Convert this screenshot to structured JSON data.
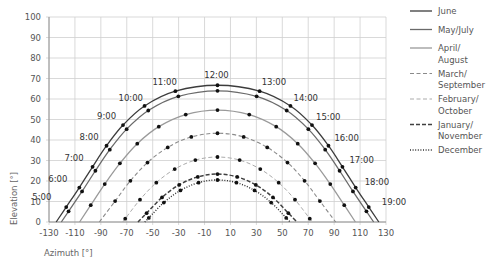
{
  "chart_data": {
    "type": "line",
    "title": "",
    "xlabel": "Azimuth [°]",
    "ylabel": "Elevation [°]",
    "xlim": [
      -130,
      130
    ],
    "ylim": [
      0,
      100
    ],
    "xticks": [
      -130,
      -110,
      -90,
      -70,
      -50,
      -30,
      -10,
      10,
      30,
      50,
      70,
      90,
      110,
      130
    ],
    "yticks": [
      0,
      10,
      20,
      30,
      40,
      50,
      60,
      70,
      80,
      90,
      100
    ],
    "grid": true,
    "legend_position": "right",
    "time_labels": [
      "5:00",
      "6:00",
      "7:00",
      "8:00",
      "9:00",
      "10:00",
      "11:00",
      "12:00",
      "13:00",
      "14:00",
      "15:00",
      "16:00",
      "17:00",
      "18:00",
      "19:00"
    ],
    "series": [
      {
        "name": "June",
        "legend_lines": [
          "June"
        ],
        "style": "solid",
        "color": "#3c3c3c",
        "points": [
          {
            "time": "5:00",
            "az": -116.7,
            "el": 7.3
          },
          {
            "time": "6:00",
            "az": -106.6,
            "el": 16.8
          },
          {
            "time": "7:00",
            "az": -96.4,
            "el": 26.9
          },
          {
            "time": "8:00",
            "az": -85.6,
            "el": 37.2
          },
          {
            "time": "9:00",
            "az": -72.9,
            "el": 47.3
          },
          {
            "time": "10:00",
            "az": -56.3,
            "el": 56.6
          },
          {
            "time": "11:00",
            "az": -32.5,
            "el": 63.8
          },
          {
            "time": "12:00",
            "az": 0,
            "el": 66.7
          },
          {
            "time": "13:00",
            "az": 32.5,
            "el": 63.8
          },
          {
            "time": "14:00",
            "az": 56.3,
            "el": 56.6
          },
          {
            "time": "15:00",
            "az": 72.9,
            "el": 47.3
          },
          {
            "time": "16:00",
            "az": 85.6,
            "el": 37.2
          },
          {
            "time": "17:00",
            "az": 96.4,
            "el": 26.9
          },
          {
            "time": "18:00",
            "az": 106.6,
            "el": 16.8
          },
          {
            "time": "19:00",
            "az": 116.7,
            "el": 7.3
          }
        ]
      },
      {
        "name": "May/July",
        "legend_lines": [
          "May/July"
        ],
        "style": "solid",
        "color": "#6a6a6a",
        "points": [
          {
            "time": "5:00",
            "az": -114.9,
            "el": 5.2
          },
          {
            "time": "6:00",
            "az": -104.5,
            "el": 14.9
          },
          {
            "time": "7:00",
            "az": -94.2,
            "el": 25.0
          },
          {
            "time": "8:00",
            "az": -83.1,
            "el": 35.3
          },
          {
            "time": "9:00",
            "az": -70.1,
            "el": 45.3
          },
          {
            "time": "10:00",
            "az": -53.4,
            "el": 54.4
          },
          {
            "time": "11:00",
            "az": -30.2,
            "el": 61.3
          },
          {
            "time": "12:00",
            "az": 0,
            "el": 64.0
          },
          {
            "time": "13:00",
            "az": 30.2,
            "el": 61.3
          },
          {
            "time": "14:00",
            "az": 53.4,
            "el": 54.4
          },
          {
            "time": "15:00",
            "az": 70.1,
            "el": 45.3
          },
          {
            "time": "16:00",
            "az": 83.1,
            "el": 35.3
          },
          {
            "time": "17:00",
            "az": 94.2,
            "el": 25.0
          },
          {
            "time": "18:00",
            "az": 104.5,
            "el": 14.9
          },
          {
            "time": "19:00",
            "az": 114.9,
            "el": 5.2
          }
        ]
      },
      {
        "name": "April/August",
        "legend_lines": [
          "April/",
          "August"
        ],
        "style": "solid",
        "color": "#9a9a9a",
        "points": [
          {
            "time": "6:00",
            "az": -97.8,
            "el": 8.2
          },
          {
            "time": "7:00",
            "az": -87.0,
            "el": 18.5
          },
          {
            "time": "8:00",
            "az": -75.3,
            "el": 28.6
          },
          {
            "time": "9:00",
            "az": -61.9,
            "el": 38.2
          },
          {
            "time": "10:00",
            "az": -45.3,
            "el": 46.5
          },
          {
            "time": "11:00",
            "az": -24.5,
            "el": 52.4
          },
          {
            "time": "12:00",
            "az": 0,
            "el": 54.6
          },
          {
            "time": "13:00",
            "az": 24.5,
            "el": 52.4
          },
          {
            "time": "14:00",
            "az": 45.3,
            "el": 46.5
          },
          {
            "time": "15:00",
            "az": 61.9,
            "el": 38.2
          },
          {
            "time": "16:00",
            "az": 75.3,
            "el": 28.6
          },
          {
            "time": "17:00",
            "az": 87.0,
            "el": 18.5
          },
          {
            "time": "18:00",
            "az": 97.8,
            "el": 8.2
          }
        ]
      },
      {
        "name": "March/September",
        "legend_lines": [
          "March/",
          "September"
        ],
        "style": "dashed",
        "color": "#8a8a8a",
        "points": [
          {
            "time": "7:00",
            "az": -79.0,
            "el": 10.2
          },
          {
            "time": "8:00",
            "az": -67.2,
            "el": 20.1
          },
          {
            "time": "9:00",
            "az": -54.0,
            "el": 29.0
          },
          {
            "time": "10:00",
            "az": -38.4,
            "el": 36.4
          },
          {
            "time": "11:00",
            "az": -20.2,
            "el": 41.5
          },
          {
            "time": "12:00",
            "az": 0,
            "el": 43.3
          },
          {
            "time": "13:00",
            "az": 20.2,
            "el": 41.5
          },
          {
            "time": "14:00",
            "az": 38.4,
            "el": 36.4
          },
          {
            "time": "15:00",
            "az": 54.0,
            "el": 29.0
          },
          {
            "time": "16:00",
            "az": 67.2,
            "el": 20.1
          },
          {
            "time": "17:00",
            "az": 79.0,
            "el": 10.2
          }
        ]
      },
      {
        "name": "February/October",
        "legend_lines": [
          "February/",
          "October"
        ],
        "style": "dashed-light",
        "color": "#ababab",
        "points": [
          {
            "time": "7:00",
            "az": -71.2,
            "el": 1.6
          },
          {
            "time": "8:00",
            "az": -59.8,
            "el": 10.9
          },
          {
            "time": "9:00",
            "az": -47.2,
            "el": 19.2
          },
          {
            "time": "10:00",
            "az": -33.0,
            "el": 25.8
          },
          {
            "time": "11:00",
            "az": -17.1,
            "el": 30.2
          },
          {
            "time": "12:00",
            "az": 0,
            "el": 31.7
          },
          {
            "time": "13:00",
            "az": 17.1,
            "el": 30.2
          },
          {
            "time": "14:00",
            "az": 33.0,
            "el": 25.8
          },
          {
            "time": "15:00",
            "az": 47.2,
            "el": 19.2
          },
          {
            "time": "16:00",
            "az": 59.8,
            "el": 10.9
          },
          {
            "time": "17:00",
            "az": 71.2,
            "el": 1.6
          }
        ]
      },
      {
        "name": "January/November",
        "legend_lines": [
          "January/",
          "November"
        ],
        "style": "dashed-bold",
        "color": "#404040",
        "points": [
          {
            "time": "8:00",
            "az": -54.7,
            "el": 4.3
          },
          {
            "time": "9:00",
            "az": -42.8,
            "el": 12.0
          },
          {
            "time": "10:00",
            "az": -29.6,
            "el": 18.1
          },
          {
            "time": "11:00",
            "az": -15.2,
            "el": 22.0
          },
          {
            "time": "12:00",
            "az": 0,
            "el": 23.4
          },
          {
            "time": "13:00",
            "az": 15.2,
            "el": 22.0
          },
          {
            "time": "14:00",
            "az": 29.6,
            "el": 18.1
          },
          {
            "time": "15:00",
            "az": 42.8,
            "el": 12.0
          },
          {
            "time": "16:00",
            "az": 54.7,
            "el": 4.3
          }
        ]
      },
      {
        "name": "December",
        "legend_lines": [
          "December"
        ],
        "style": "dotted",
        "color": "#303030",
        "points": [
          {
            "time": "8:00",
            "az": -53.0,
            "el": 2.0
          },
          {
            "time": "9:00",
            "az": -41.4,
            "el": 9.5
          },
          {
            "time": "10:00",
            "az": -28.6,
            "el": 15.4
          },
          {
            "time": "11:00",
            "az": -14.6,
            "el": 19.2
          },
          {
            "time": "12:00",
            "az": 0,
            "el": 20.5
          },
          {
            "time": "13:00",
            "az": 14.6,
            "el": 19.2
          },
          {
            "time": "14:00",
            "az": 28.6,
            "el": 15.4
          },
          {
            "time": "15:00",
            "az": 41.4,
            "el": 9.5
          },
          {
            "time": "16:00",
            "az": 53.0,
            "el": 2.0
          }
        ]
      }
    ]
  }
}
